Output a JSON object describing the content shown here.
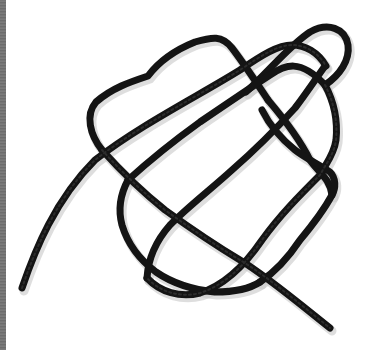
{
  "image": {
    "subject": "Black rope tied in a loose overhand-style knot pattern on white background",
    "background_color": "#ffffff",
    "rope_color": "#141414",
    "edge_strip_color": "#757575"
  },
  "rope": {
    "strands": [
      {
        "name": "left-tail-to-top-arc",
        "d": "M22,288 C35,250 55,200 95,160 C140,125 200,95 240,70 C262,55 278,45 292,45 C305,45 318,52 326,66"
      },
      {
        "name": "upper-left-loop",
        "d": "M102,150 C90,135 85,115 96,102 C112,88 130,82 148,76 C160,60 175,50 195,42 C212,37 222,35 232,48 C245,65 258,85 268,100"
      },
      {
        "name": "top-right-loop",
        "d": "M246,92 C270,70 290,45 310,32 C328,22 345,28 348,45 C350,60 340,75 325,85"
      },
      {
        "name": "center-diagonal-down",
        "d": "M268,100 C285,120 300,140 310,160 C318,172 330,178 332,195"
      },
      {
        "name": "right-side-descent",
        "d": "M325,85 C333,100 338,120 336,140 C334,155 325,165 320,175 C300,195 280,215 262,240 C245,265 225,285 200,293 C180,298 160,292 147,278"
      },
      {
        "name": "long-diagonal-upper",
        "d": "M128,180 C150,160 175,140 200,122 C225,105 250,88 270,75 C285,65 300,58 325,85"
      },
      {
        "name": "mid-left-loop",
        "d": "M128,180 C120,195 118,210 122,225 C128,245 140,260 156,272 C175,285 195,290 215,292 C232,292 248,290 260,282"
      },
      {
        "name": "cross-diagonal-lower",
        "d": "M102,150 C120,170 140,190 165,210 C190,228 215,245 240,260 C265,275 295,300 330,328"
      },
      {
        "name": "inner-diagonal-up",
        "d": "M147,278 C148,260 155,242 170,225 C190,205 210,190 232,170 C255,150 275,130 295,108 C305,95 315,80 325,66"
      },
      {
        "name": "lower-right-loop",
        "d": "M260,282 C275,272 290,255 300,240 C315,222 325,208 332,195 C336,188 336,178 330,172 C320,165 305,158 295,150 C280,138 268,122 262,110"
      }
    ]
  }
}
